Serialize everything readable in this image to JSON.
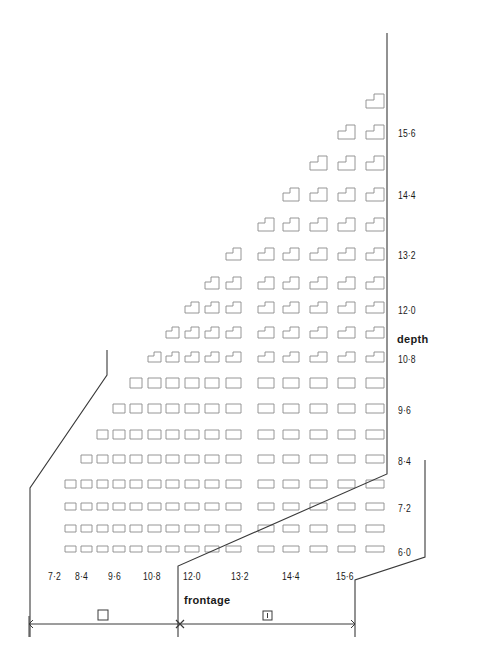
{
  "colors": {
    "line": "#3a3a3a",
    "cell": "#8a8a8a",
    "text": "#1a1a1a",
    "background": "#ffffff"
  },
  "axes": {
    "depth": {
      "title": "depth",
      "ticks": [
        {
          "label": "15·6",
          "y": 134
        },
        {
          "label": "14·4",
          "y": 196
        },
        {
          "label": "13·2",
          "y": 256
        },
        {
          "label": "12·0",
          "y": 311
        },
        {
          "label": "10·8",
          "y": 360
        },
        {
          "label": "9·6",
          "y": 411
        },
        {
          "label": "8·4",
          "y": 462
        },
        {
          "label": "7·2",
          "y": 509
        },
        {
          "label": "6·0",
          "y": 553
        }
      ]
    },
    "frontage": {
      "title": "frontage",
      "ticks": [
        {
          "label": "7·2",
          "x": 48
        },
        {
          "label": "8·4",
          "x": 75
        },
        {
          "label": "9·6",
          "x": 108
        },
        {
          "label": "10·8",
          "x": 143
        },
        {
          "label": "12·0",
          "x": 183
        },
        {
          "label": "13·2",
          "x": 231
        },
        {
          "label": "14·4",
          "x": 282
        },
        {
          "label": "15·6",
          "x": 336
        }
      ]
    }
  },
  "dimension": {
    "left_symbol": "square",
    "right_symbol": "boxed-I",
    "right_symbol_text": "I"
  },
  "grid": {
    "columns_x": [
      50,
      65,
      81,
      97,
      113,
      130,
      148,
      166,
      185,
      205,
      226,
      258,
      283,
      310,
      338,
      366
    ],
    "column_widths": [
      10,
      11,
      11,
      11,
      12,
      12,
      13,
      13,
      14,
      14,
      15,
      16,
      16,
      17,
      17,
      18
    ],
    "rows": [
      {
        "y": 94,
        "h": 14,
        "count": 1,
        "shape": "notched"
      },
      {
        "y": 125,
        "h": 14,
        "count": 2,
        "shape": "notched"
      },
      {
        "y": 156,
        "h": 14,
        "count": 3,
        "shape": "notched"
      },
      {
        "y": 188,
        "h": 13,
        "count": 4,
        "shape": "notched"
      },
      {
        "y": 218,
        "h": 13,
        "count": 5,
        "shape": "notched"
      },
      {
        "y": 248,
        "h": 12,
        "count": 6,
        "shape": "notched"
      },
      {
        "y": 277,
        "h": 12,
        "count": 7,
        "shape": "notched"
      },
      {
        "y": 302,
        "h": 11,
        "count": 8,
        "shape": "notched"
      },
      {
        "y": 327,
        "h": 11,
        "count": 9,
        "shape": "notched"
      },
      {
        "y": 352,
        "h": 10,
        "count": 10,
        "shape": "notched"
      },
      {
        "y": 378,
        "h": 10,
        "count": 11,
        "shape": "rect"
      },
      {
        "y": 404,
        "h": 9,
        "count": 12,
        "shape": "rect"
      },
      {
        "y": 430,
        "h": 9,
        "count": 13,
        "shape": "rect"
      },
      {
        "y": 455,
        "h": 8,
        "count": 14,
        "shape": "rect"
      },
      {
        "y": 480,
        "h": 8,
        "count": 15,
        "shape": "rect"
      },
      {
        "y": 503,
        "h": 7,
        "count": 15,
        "shape": "rect"
      },
      {
        "y": 525,
        "h": 7,
        "count": 15,
        "shape": "rect"
      },
      {
        "y": 546,
        "h": 6,
        "count": 15,
        "shape": "rect"
      }
    ]
  },
  "boundaries": [
    {
      "name": "outer-right-boundary",
      "points": [
        [
          387,
          33
        ],
        [
          387,
          474
        ],
        [
          178,
          566
        ],
        [
          178,
          637
        ]
      ]
    },
    {
      "name": "inner-right-boundary",
      "points": [
        [
          425,
          460
        ],
        [
          425,
          557
        ],
        [
          355,
          580
        ],
        [
          355,
          637
        ]
      ]
    },
    {
      "name": "left-boundary",
      "points": [
        [
          107,
          350
        ],
        [
          107,
          375
        ],
        [
          30,
          488
        ],
        [
          30,
          637
        ]
      ]
    }
  ]
}
